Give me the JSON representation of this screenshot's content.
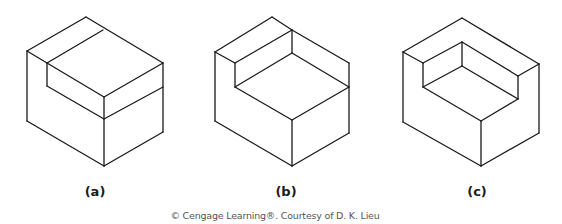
{
  "figures": [
    {
      "id": "a",
      "label": "(a)",
      "label_x": 95,
      "description": "Isometric block with a raised step on the left-back; right portion full height",
      "edges": [
        [
          [
            86,
            17
          ],
          [
            27,
            51
          ]
        ],
        [
          [
            86,
            17
          ],
          [
            163,
            63
          ]
        ],
        [
          [
            103,
            30
          ],
          [
            47,
            63
          ]
        ],
        [
          [
            27,
            51
          ],
          [
            47,
            63
          ]
        ],
        [
          [
            27,
            51
          ],
          [
            27,
            121
          ]
        ],
        [
          [
            47,
            63
          ],
          [
            47,
            86
          ]
        ],
        [
          [
            47,
            63
          ],
          [
            104,
            97
          ]
        ],
        [
          [
            104,
            97
          ],
          [
            163,
            63
          ]
        ],
        [
          [
            163,
            63
          ],
          [
            163,
            132
          ]
        ],
        [
          [
            47,
            86
          ],
          [
            104,
            119
          ]
        ],
        [
          [
            104,
            97
          ],
          [
            104,
            166
          ]
        ],
        [
          [
            104,
            119
          ],
          [
            163,
            87
          ]
        ],
        [
          [
            27,
            121
          ],
          [
            104,
            166
          ]
        ],
        [
          [
            104,
            166
          ],
          [
            163,
            132
          ]
        ]
      ]
    },
    {
      "id": "b",
      "label": "(b)",
      "label_x": 286,
      "description": "Isometric L-shaped block with tall back wall and lower front seat",
      "edges": [
        [
          [
            272,
            17
          ],
          [
            215,
            52
          ]
        ],
        [
          [
            272,
            17
          ],
          [
            292,
            30
          ]
        ],
        [
          [
            292,
            30
          ],
          [
            235,
            63
          ]
        ],
        [
          [
            215,
            52
          ],
          [
            235,
            63
          ]
        ],
        [
          [
            292,
            30
          ],
          [
            349,
            63
          ]
        ],
        [
          [
            292,
            30
          ],
          [
            292,
            53
          ]
        ],
        [
          [
            235,
            63
          ],
          [
            235,
            87
          ]
        ],
        [
          [
            235,
            87
          ],
          [
            292,
            53
          ]
        ],
        [
          [
            292,
            53
          ],
          [
            349,
            87
          ]
        ],
        [
          [
            349,
            63
          ],
          [
            349,
            133
          ]
        ],
        [
          [
            235,
            87
          ],
          [
            292,
            120
          ]
        ],
        [
          [
            292,
            120
          ],
          [
            349,
            87
          ]
        ],
        [
          [
            215,
            52
          ],
          [
            215,
            121
          ]
        ],
        [
          [
            292,
            120
          ],
          [
            292,
            166
          ]
        ],
        [
          [
            215,
            121
          ],
          [
            292,
            166
          ]
        ],
        [
          [
            292,
            166
          ],
          [
            349,
            133
          ]
        ]
      ]
    },
    {
      "id": "c",
      "label": "(c)",
      "label_x": 477,
      "description": "Isometric block with U-shaped recess (walls on back, left and right)",
      "edges": [
        [
          [
            462,
            18
          ],
          [
            403,
            52
          ]
        ],
        [
          [
            462,
            18
          ],
          [
            539,
            64
          ]
        ],
        [
          [
            403,
            52
          ],
          [
            423,
            63
          ]
        ],
        [
          [
            423,
            63
          ],
          [
            462,
            42
          ]
        ],
        [
          [
            462,
            42
          ],
          [
            518,
            76
          ]
        ],
        [
          [
            518,
            76
          ],
          [
            539,
            64
          ]
        ],
        [
          [
            423,
            63
          ],
          [
            423,
            87
          ]
        ],
        [
          [
            462,
            42
          ],
          [
            462,
            66
          ]
        ],
        [
          [
            518,
            76
          ],
          [
            518,
            99
          ]
        ],
        [
          [
            423,
            87
          ],
          [
            462,
            66
          ]
        ],
        [
          [
            462,
            66
          ],
          [
            518,
            99
          ]
        ],
        [
          [
            423,
            87
          ],
          [
            481,
            121
          ]
        ],
        [
          [
            481,
            121
          ],
          [
            518,
            99
          ]
        ],
        [
          [
            403,
            52
          ],
          [
            403,
            122
          ]
        ],
        [
          [
            539,
            64
          ],
          [
            539,
            133
          ]
        ],
        [
          [
            481,
            121
          ],
          [
            481,
            166
          ]
        ],
        [
          [
            403,
            122
          ],
          [
            481,
            166
          ]
        ],
        [
          [
            481,
            166
          ],
          [
            539,
            133
          ]
        ]
      ]
    }
  ],
  "credit": "© Cengage Learning®. Courtesy of D. K. Lieu",
  "colors": {
    "line": "#1a1a1a",
    "background": "#ffffff",
    "credit_text": "#555555"
  }
}
